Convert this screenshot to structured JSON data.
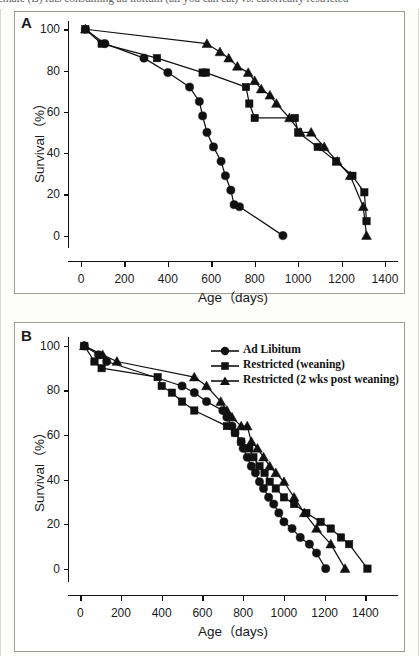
{
  "caption": {
    "text": "female (B) rats consuming ad libitum (all you can eat) vs. calorically restricted"
  },
  "legend": {
    "items": [
      {
        "label": "Ad Libitum",
        "marker": "circle-marker"
      },
      {
        "label": "Restricted (weaning)",
        "marker": "square-marker"
      },
      {
        "label": "Restricted (2 wks post weaning)",
        "marker": "triangle-marker"
      }
    ]
  },
  "panels": [
    {
      "letter": "A"
    },
    {
      "letter": "B"
    }
  ],
  "chart_data": [
    {
      "type": "line",
      "panel": "A",
      "title": "",
      "xlabel": "Age（days)",
      "ylabel": "Survival（%）",
      "xlim": [
        -60,
        1460
      ],
      "ylim": [
        -6,
        104
      ],
      "xticks": [
        0,
        200,
        400,
        600,
        800,
        1000,
        1200,
        1400
      ],
      "yticks": [
        0,
        20,
        40,
        60,
        80,
        100
      ],
      "grid": false,
      "legend_position": "none",
      "series": [
        {
          "name": "Ad Libitum",
          "marker": "circle",
          "x": [
            20,
            110,
            290,
            400,
            500,
            545,
            560,
            580,
            610,
            645,
            665,
            690,
            705,
            730,
            930
          ],
          "values": [
            100,
            93,
            86,
            79,
            72,
            65,
            58,
            50,
            43,
            36,
            29,
            22,
            15,
            14,
            0
          ]
        },
        {
          "name": "Restricted (weaning)",
          "marker": "square",
          "x": [
            20,
            95,
            350,
            560,
            575,
            760,
            775,
            800,
            985,
            1000,
            1090,
            1175,
            1250,
            1305,
            1315
          ],
          "values": [
            100,
            93,
            86,
            79,
            79,
            72,
            64,
            57,
            57,
            50,
            43,
            36,
            29,
            21,
            7
          ]
        },
        {
          "name": "Restricted (2 wks post weaning)",
          "marker": "triangle",
          "x": [
            20,
            580,
            640,
            680,
            720,
            770,
            800,
            830,
            870,
            900,
            960,
            1010,
            1060,
            1120,
            1180,
            1240,
            1300,
            1315
          ],
          "values": [
            100,
            93,
            89,
            86,
            82,
            79,
            75,
            71,
            68,
            64,
            57,
            50,
            50,
            43,
            36,
            29,
            14,
            0
          ]
        }
      ]
    },
    {
      "type": "line",
      "panel": "B",
      "title": "",
      "xlabel": "Age（days)",
      "ylabel": "Survival（%）",
      "xlim": [
        -60,
        1560
      ],
      "ylim": [
        -6,
        104
      ],
      "xticks": [
        0,
        200,
        400,
        600,
        800,
        1000,
        1200,
        1400
      ],
      "yticks": [
        0,
        20,
        40,
        60,
        80,
        100
      ],
      "grid": false,
      "legend_position": "top-right",
      "series": [
        {
          "name": "Ad Libitum",
          "marker": "circle",
          "x": [
            20,
            90,
            130,
            500,
            560,
            620,
            700,
            720,
            745,
            760,
            790,
            800,
            820,
            840,
            860,
            880,
            900,
            925,
            950,
            975,
            1000,
            1040,
            1080,
            1125,
            1160,
            1205
          ],
          "values": [
            100,
            96,
            93,
            82,
            79,
            75,
            71,
            68,
            64,
            61,
            57,
            54,
            50,
            46,
            43,
            39,
            36,
            32,
            29,
            25,
            21,
            18,
            14,
            11,
            7,
            0
          ]
        },
        {
          "name": "Restricted (weaning)",
          "marker": "square",
          "x": [
            20,
            70,
            105,
            380,
            400,
            450,
            500,
            560,
            720,
            760,
            790,
            830,
            850,
            880,
            905,
            930,
            960,
            1000,
            1050,
            1110,
            1180,
            1230,
            1280,
            1320,
            1410
          ],
          "values": [
            100,
            93,
            90,
            86,
            82,
            79,
            75,
            71,
            64,
            61,
            57,
            54,
            50,
            46,
            43,
            39,
            36,
            32,
            29,
            25,
            21,
            18,
            14,
            11,
            0
          ]
        },
        {
          "name": "Restricted (2 wks post weaning)",
          "marker": "triangle",
          "x": [
            20,
            110,
            180,
            560,
            620,
            690,
            720,
            745,
            790,
            820,
            840,
            870,
            900,
            930,
            960,
            1000,
            1050,
            1100,
            1160,
            1230,
            1300
          ],
          "values": [
            100,
            96,
            93,
            86,
            82,
            75,
            71,
            68,
            64,
            64,
            57,
            54,
            50,
            46,
            43,
            39,
            32,
            25,
            18,
            11,
            0
          ]
        }
      ]
    }
  ]
}
